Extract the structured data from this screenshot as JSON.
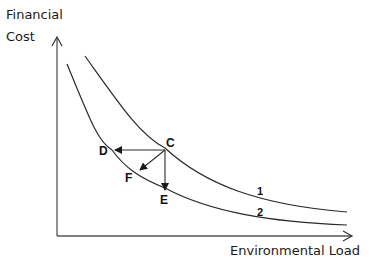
{
  "diagram": {
    "y_axis_label_line1": "Financial",
    "y_axis_label_line2": "Cost",
    "x_axis_label": "Environmental Load",
    "curves": [
      {
        "id": "1",
        "label": "1"
      },
      {
        "id": "2",
        "label": "2"
      }
    ],
    "points": {
      "C": "C",
      "D": "D",
      "E": "E",
      "F": "F"
    },
    "arrows": [
      {
        "from": "C",
        "to": "D"
      },
      {
        "from": "C",
        "to": "F"
      },
      {
        "from": "C",
        "to": "E"
      }
    ],
    "colors": {
      "line": "#2a2a2a",
      "axis": "#555555",
      "background": "#ffffff"
    }
  }
}
